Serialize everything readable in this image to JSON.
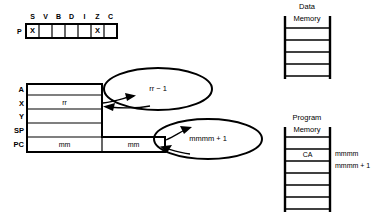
{
  "diagram": {
    "line_color": "#000000",
    "background": "#ffffff"
  },
  "status_register": {
    "label": "P",
    "flags": [
      {
        "name": "S",
        "mark": "X"
      },
      {
        "name": "V",
        "mark": ""
      },
      {
        "name": "B",
        "mark": ""
      },
      {
        "name": "D",
        "mark": ""
      },
      {
        "name": "I",
        "mark": ""
      },
      {
        "name": "Z",
        "mark": "X"
      },
      {
        "name": "C",
        "mark": ""
      }
    ]
  },
  "register_file": {
    "registers": [
      {
        "label": "A",
        "value": ""
      },
      {
        "label": "X",
        "value": "rr"
      },
      {
        "label": "Y",
        "value": ""
      },
      {
        "label": "SP",
        "value": ""
      }
    ],
    "pc": {
      "label": "PC",
      "high": "mm",
      "low": "mm"
    }
  },
  "bubbles": [
    {
      "text": "rr − 1"
    },
    {
      "text": "mmmm + 1"
    }
  ],
  "data_memory": {
    "title_line1": "Data",
    "title_line2": "Memory",
    "cells": [
      "",
      "",
      "",
      ""
    ]
  },
  "program_memory": {
    "title_line1": "Program",
    "title_line2": "Memory",
    "cells": [
      "",
      "CA",
      "",
      "",
      "",
      ""
    ],
    "addresses": [
      {
        "text": "mmmm"
      },
      {
        "text": "mmmm + 1"
      }
    ]
  }
}
